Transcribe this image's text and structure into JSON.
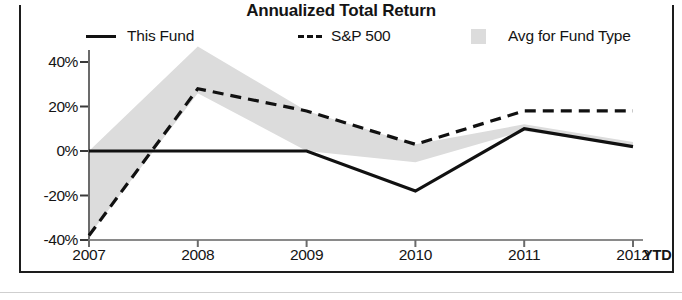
{
  "chart_data": {
    "type": "line",
    "title": "Annualized Total Return",
    "xlabel": "",
    "ylabel": "",
    "x": [
      "2007",
      "2008",
      "2009",
      "2010",
      "2011",
      "2012"
    ],
    "x_axis_suffix": "YTD",
    "ylim": [
      -40,
      40
    ],
    "yticks": [
      40,
      20,
      0,
      -20,
      -40
    ],
    "ytick_labels": [
      "40%",
      "20%",
      "0%",
      "-20%",
      "-40%"
    ],
    "grid": false,
    "legend_position": "top",
    "series": [
      {
        "name": "This Fund",
        "style": "solid",
        "color": "#111111",
        "values": [
          0,
          0,
          0,
          -18,
          10,
          2
        ]
      },
      {
        "name": "S&P 500",
        "style": "dashed",
        "color": "#111111",
        "values": [
          -38,
          28,
          18,
          3,
          18,
          18
        ]
      },
      {
        "name": "Avg for Fund Type",
        "style": "band",
        "color": "#dcdcdc",
        "band_upper": [
          0,
          47,
          18,
          3,
          12,
          4
        ],
        "band_lower": [
          -38,
          26,
          0,
          -5,
          9,
          2
        ]
      }
    ]
  },
  "legend": {
    "items": [
      {
        "label": "This Fund",
        "marker": "solid-line-icon"
      },
      {
        "label": "S&P 500",
        "marker": "dashed-line-icon"
      },
      {
        "label": "Avg for Fund Type",
        "marker": "band-swatch-icon"
      }
    ]
  }
}
